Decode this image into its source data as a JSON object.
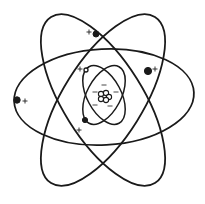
{
  "diagram": {
    "title": "",
    "colors": {
      "line": "#1a1a1a",
      "background": "#ffffff"
    },
    "outer_orbits": [
      {
        "cx": 104,
        "cy": 97,
        "rx": 90,
        "ry": 48,
        "rotate": -3
      },
      {
        "cx": 103,
        "cy": 100,
        "rx": 98,
        "ry": 40,
        "rotate": 58
      },
      {
        "cx": 103,
        "cy": 100,
        "rx": 98,
        "ry": 40,
        "rotate": -58
      }
    ],
    "inner_orbits": [
      {
        "cx": 104,
        "cy": 95,
        "rx": 32,
        "ry": 17,
        "rotate": 62
      },
      {
        "cx": 104,
        "cy": 95,
        "rx": 32,
        "ry": 17,
        "rotate": -62
      }
    ],
    "electrons": [
      {
        "x": 17,
        "y": 100,
        "r": 3.2,
        "filled": true
      },
      {
        "x": 96,
        "y": 34,
        "r": 3,
        "filled": true
      },
      {
        "x": 148,
        "y": 71,
        "r": 3.6,
        "filled": true
      },
      {
        "x": 86,
        "y": 70,
        "r": 2,
        "filled": false
      },
      {
        "x": 85,
        "y": 120,
        "r": 2.6,
        "filled": true
      }
    ],
    "plus_signs": [
      {
        "x": 25,
        "y": 101,
        "text": "+"
      },
      {
        "x": 89,
        "y": 32,
        "text": "+"
      },
      {
        "x": 155,
        "y": 69,
        "text": "+"
      },
      {
        "x": 80,
        "y": 69,
        "text": "+"
      },
      {
        "x": 79,
        "y": 130,
        "text": "+"
      }
    ],
    "minus_signs": [
      {
        "x": 104,
        "y": 85,
        "text": "−"
      },
      {
        "x": 95,
        "y": 92,
        "text": "−"
      },
      {
        "x": 116,
        "y": 92,
        "text": "−"
      },
      {
        "x": 95,
        "y": 105,
        "text": "−"
      },
      {
        "x": 110,
        "y": 106,
        "text": "−"
      }
    ],
    "nucleus": {
      "cx": 104,
      "cy": 97,
      "particles": [
        {
          "x": 101,
          "y": 94,
          "r": 2.6
        },
        {
          "x": 106,
          "y": 93,
          "r": 2.6
        },
        {
          "x": 109,
          "y": 97,
          "r": 2.6
        },
        {
          "x": 101,
          "y": 99,
          "r": 2.6
        },
        {
          "x": 106,
          "y": 100,
          "r": 2.6
        }
      ]
    }
  }
}
